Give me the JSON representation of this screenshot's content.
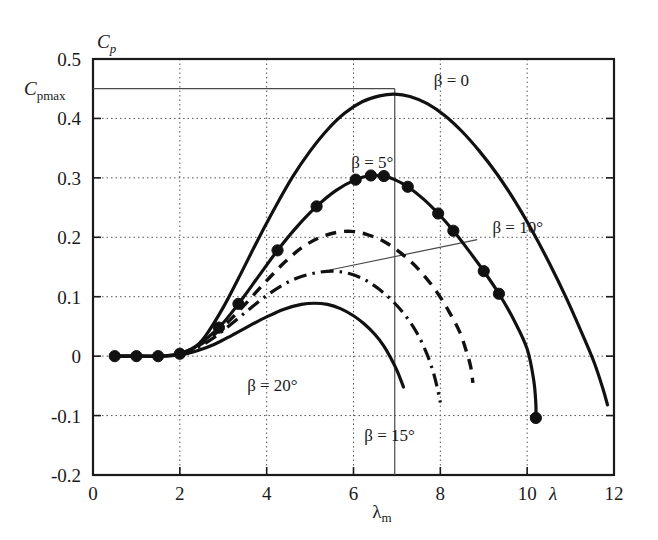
{
  "chart_data": {
    "type": "line",
    "title": "",
    "xlabel": "λ",
    "ylabel": "C_p",
    "xlim": [
      0,
      12
    ],
    "ylim": [
      -0.2,
      0.5
    ],
    "grid": true,
    "legend_position": "inline-annotations",
    "x_ticks": [
      "0",
      "2",
      "4",
      "6",
      "8",
      "10",
      "12"
    ],
    "x_tick_values": [
      0,
      2,
      4,
      6,
      8,
      10,
      12
    ],
    "y_ticks": [
      "0.5",
      "0.4",
      "0.3",
      "0.2",
      "0.1",
      "0",
      "-0.1",
      "-0.2"
    ],
    "y_tick_values": [
      0.5,
      0.4,
      0.3,
      0.2,
      0.1,
      0,
      -0.1,
      -0.2
    ],
    "annotations": {
      "cpmax_label": "C",
      "cpmax_sub": "pmax",
      "cpmax_value": 0.45,
      "lambda_m_label": "λ",
      "lambda_m_sub": "m",
      "lambda_m_value": 6.95,
      "y_axis_symbol": "C",
      "y_axis_sub": "p",
      "x_axis_symbol": "λ"
    },
    "series": [
      {
        "name": "β = 0",
        "label": "β = 0",
        "style": "solid",
        "markers": false,
        "label_x": 7.85,
        "label_y": 0.455,
        "points": [
          [
            0.5,
            0.0
          ],
          [
            1.0,
            0.0
          ],
          [
            1.5,
            0.0
          ],
          [
            2.0,
            0.003
          ],
          [
            2.3,
            0.012
          ],
          [
            2.6,
            0.035
          ],
          [
            3.0,
            0.082
          ],
          [
            3.4,
            0.138
          ],
          [
            3.8,
            0.196
          ],
          [
            4.2,
            0.251
          ],
          [
            4.6,
            0.302
          ],
          [
            5.0,
            0.345
          ],
          [
            5.4,
            0.381
          ],
          [
            5.8,
            0.409
          ],
          [
            6.2,
            0.428
          ],
          [
            6.6,
            0.438
          ],
          [
            6.95,
            0.441
          ],
          [
            7.3,
            0.437
          ],
          [
            7.7,
            0.425
          ],
          [
            8.1,
            0.405
          ],
          [
            8.5,
            0.378
          ],
          [
            8.9,
            0.345
          ],
          [
            9.3,
            0.307
          ],
          [
            9.7,
            0.263
          ],
          [
            10.1,
            0.213
          ],
          [
            10.5,
            0.158
          ],
          [
            10.9,
            0.098
          ],
          [
            11.3,
            0.032
          ],
          [
            11.55,
            -0.012
          ],
          [
            11.75,
            -0.056
          ],
          [
            11.85,
            -0.082
          ]
        ]
      },
      {
        "name": "β = 5°",
        "label": "β = 5°",
        "style": "solid",
        "markers": true,
        "label_x": 5.95,
        "label_y": 0.317,
        "points": [
          [
            0.5,
            0.0
          ],
          [
            1.0,
            0.0
          ],
          [
            1.5,
            0.0
          ],
          [
            2.0,
            0.004
          ],
          [
            2.4,
            0.018
          ],
          [
            2.9,
            0.048
          ],
          [
            3.35,
            0.088
          ],
          [
            3.8,
            0.133
          ],
          [
            4.25,
            0.178
          ],
          [
            4.7,
            0.218
          ],
          [
            5.15,
            0.252
          ],
          [
            5.6,
            0.279
          ],
          [
            6.05,
            0.297
          ],
          [
            6.4,
            0.304
          ],
          [
            6.7,
            0.303
          ],
          [
            6.95,
            0.297
          ],
          [
            7.25,
            0.285
          ],
          [
            7.6,
            0.265
          ],
          [
            7.95,
            0.24
          ],
          [
            8.3,
            0.211
          ],
          [
            8.65,
            0.178
          ],
          [
            9.0,
            0.143
          ],
          [
            9.35,
            0.105
          ],
          [
            9.7,
            0.06
          ],
          [
            10.0,
            0.012
          ],
          [
            10.15,
            -0.04
          ],
          [
            10.2,
            -0.08
          ],
          [
            10.2,
            -0.104
          ]
        ],
        "marker_points": [
          [
            0.5,
            0.0
          ],
          [
            1.0,
            0.0
          ],
          [
            1.5,
            0.0
          ],
          [
            2.0,
            0.004
          ],
          [
            2.9,
            0.048
          ],
          [
            3.35,
            0.088
          ],
          [
            4.25,
            0.178
          ],
          [
            5.15,
            0.252
          ],
          [
            6.05,
            0.297
          ],
          [
            6.4,
            0.304
          ],
          [
            6.7,
            0.303
          ],
          [
            7.25,
            0.285
          ],
          [
            7.95,
            0.24
          ],
          [
            8.3,
            0.211
          ],
          [
            9.0,
            0.143
          ],
          [
            9.35,
            0.105
          ],
          [
            10.2,
            -0.104
          ]
        ]
      },
      {
        "name": "β = 10°",
        "label": "β = 10°",
        "style": "dashed",
        "markers": false,
        "label_x": 9.2,
        "label_y": 0.208,
        "leader_from": [
          8.85,
          0.196
        ],
        "leader_to": [
          5.45,
          0.145
        ],
        "points": [
          [
            2.0,
            0.004
          ],
          [
            2.4,
            0.016
          ],
          [
            2.8,
            0.037
          ],
          [
            3.2,
            0.064
          ],
          [
            3.6,
            0.095
          ],
          [
            4.0,
            0.127
          ],
          [
            4.4,
            0.157
          ],
          [
            4.8,
            0.182
          ],
          [
            5.2,
            0.199
          ],
          [
            5.6,
            0.208
          ],
          [
            5.95,
            0.21
          ],
          [
            6.3,
            0.205
          ],
          [
            6.7,
            0.193
          ],
          [
            7.1,
            0.173
          ],
          [
            7.5,
            0.146
          ],
          [
            7.9,
            0.11
          ],
          [
            8.2,
            0.075
          ],
          [
            8.45,
            0.04
          ],
          [
            8.6,
            0.008
          ],
          [
            8.7,
            -0.018
          ],
          [
            8.75,
            -0.045
          ]
        ]
      },
      {
        "name": "β = 15°",
        "label": "β = 15°",
        "style": "dashdot",
        "markers": false,
        "label_x": 6.25,
        "label_y": -0.142,
        "points": [
          [
            2.0,
            0.004
          ],
          [
            2.4,
            0.014
          ],
          [
            2.8,
            0.032
          ],
          [
            3.2,
            0.055
          ],
          [
            3.6,
            0.079
          ],
          [
            4.0,
            0.102
          ],
          [
            4.4,
            0.121
          ],
          [
            4.8,
            0.134
          ],
          [
            5.2,
            0.141
          ],
          [
            5.55,
            0.143
          ],
          [
            5.9,
            0.139
          ],
          [
            6.25,
            0.129
          ],
          [
            6.6,
            0.112
          ],
          [
            6.95,
            0.089
          ],
          [
            7.25,
            0.063
          ],
          [
            7.5,
            0.034
          ],
          [
            7.7,
            0.002
          ],
          [
            7.85,
            -0.03
          ],
          [
            7.95,
            -0.06
          ],
          [
            8.0,
            -0.078
          ]
        ]
      },
      {
        "name": "β = 20°",
        "label": "β = 20°",
        "style": "solid",
        "markers": false,
        "label_x": 3.55,
        "label_y": -0.058,
        "points": [
          [
            0.5,
            0.0
          ],
          [
            1.0,
            0.0
          ],
          [
            1.5,
            0.0
          ],
          [
            2.0,
            0.002
          ],
          [
            2.4,
            0.009
          ],
          [
            2.8,
            0.02
          ],
          [
            3.2,
            0.035
          ],
          [
            3.6,
            0.051
          ],
          [
            4.0,
            0.066
          ],
          [
            4.4,
            0.079
          ],
          [
            4.8,
            0.087
          ],
          [
            5.1,
            0.089
          ],
          [
            5.4,
            0.087
          ],
          [
            5.7,
            0.08
          ],
          [
            6.0,
            0.068
          ],
          [
            6.25,
            0.054
          ],
          [
            6.5,
            0.036
          ],
          [
            6.7,
            0.017
          ],
          [
            6.85,
            -0.002
          ],
          [
            7.0,
            -0.024
          ],
          [
            7.1,
            -0.042
          ],
          [
            7.15,
            -0.052
          ]
        ]
      }
    ]
  }
}
